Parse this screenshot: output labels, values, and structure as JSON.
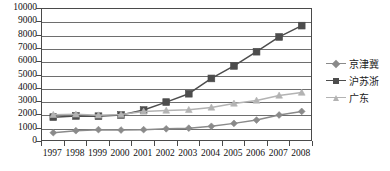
{
  "chart_data": {
    "type": "line",
    "title": "",
    "subtitle": "",
    "xlabel": "",
    "ylabel": "",
    "categories": [
      "1997",
      "1998",
      "1999",
      "2000",
      "2001",
      "2002",
      "2003",
      "2004",
      "2005",
      "2006",
      "2007",
      "2008"
    ],
    "ylim": [
      0,
      10000
    ],
    "ytick_step": 1000,
    "yticks": [
      "0",
      "1000",
      "2000",
      "3000",
      "4000",
      "5000",
      "6000",
      "7000",
      "8000",
      "9000",
      "10000"
    ],
    "grid": true,
    "legend_position": "right",
    "series": [
      {
        "name": "京津冀",
        "marker": "diamond",
        "color": "#8a8a8a",
        "values": [
          700,
          850,
          930,
          900,
          930,
          990,
          1040,
          1180,
          1400,
          1650,
          2030,
          2300
        ]
      },
      {
        "name": "沪苏浙",
        "marker": "square",
        "color": "#4d4d4d",
        "values": [
          1870,
          1960,
          1940,
          2030,
          2400,
          3000,
          3630,
          4780,
          5720,
          6790,
          7900,
          8750
        ]
      },
      {
        "name": "广东",
        "marker": "triangle",
        "color": "#b3b3b3",
        "values": [
          2050,
          2080,
          2010,
          2060,
          2300,
          2370,
          2420,
          2600,
          2900,
          3120,
          3500,
          3720
        ]
      }
    ]
  },
  "legend": {
    "items": [
      {
        "label": "京津冀",
        "color": "#8a8a8a",
        "marker": "diamond"
      },
      {
        "label": "沪苏浙",
        "color": "#4d4d4d",
        "marker": "square"
      },
      {
        "label": "广东",
        "color": "#b3b3b3",
        "marker": "triangle"
      }
    ]
  },
  "axes": {
    "y_max_label": "10000",
    "y_min_label": "0"
  }
}
